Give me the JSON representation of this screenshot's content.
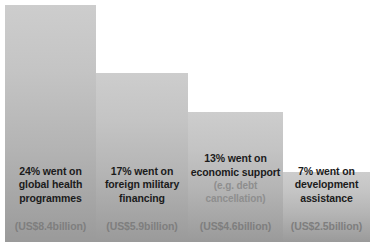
{
  "chart_data": {
    "type": "bar",
    "title": "",
    "subtitle": "",
    "xlabel": "",
    "ylabel": "",
    "grid": false,
    "legend": "none",
    "ylim": [
      0,
      24
    ],
    "categories": [
      "global health programmes",
      "foreign military financing",
      "economic support",
      "development assistance"
    ],
    "values": [
      24,
      17,
      13,
      7
    ],
    "value_unit": "percent",
    "amounts_usd_billion": [
      8.4,
      5.9,
      4.6,
      2.5
    ],
    "bars": [
      {
        "percent_label": "24% went on",
        "category_label": "global health\nprogrammes",
        "category_line_1": "global health",
        "category_line_2": "programmes",
        "note": "",
        "amount_label": "(US$8.4billion)",
        "value": 24,
        "amount_usd_billion": 8.4
      },
      {
        "percent_label": "17% went on",
        "category_label": "foreign military\nfinancing",
        "category_line_1": "foreign military",
        "category_line_2": "financing",
        "note": "",
        "amount_label": "(US$5.9billion)",
        "value": 17,
        "amount_usd_billion": 5.9
      },
      {
        "percent_label": "13% went on",
        "category_label": "economic support",
        "category_line_1": "economic support",
        "category_line_2": "",
        "note": "(e.g. debt cancellation)",
        "note_line_1": "(e.g. debt",
        "note_line_2": "cancellation)",
        "amount_label": "(US$4.6billion)",
        "value": 13,
        "amount_usd_billion": 4.6
      },
      {
        "percent_label": "7% went on",
        "category_label": "development\nassistance",
        "category_line_1": "development",
        "category_line_2": "assistance",
        "note": "",
        "amount_label": "(US$2.5billion)",
        "value": 7,
        "amount_usd_billion": 2.5
      }
    ],
    "colors": {
      "bar_gradient_top": "#cdcdcd",
      "bar_gradient_bottom": "#9a9a9a",
      "label_text": "#1b1b1b",
      "note_text": "#8e8e8e",
      "amount_text": "#7e7e7e",
      "background": "#ffffff"
    }
  }
}
